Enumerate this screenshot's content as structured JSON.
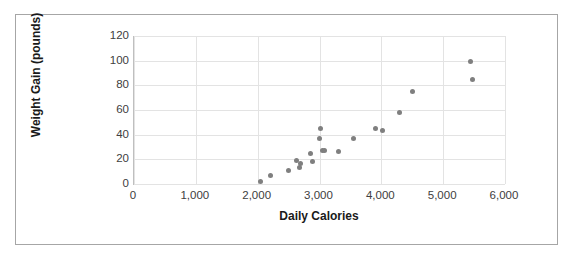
{
  "chart_data": {
    "type": "scatter",
    "title": "",
    "xlabel": "Daily Calories",
    "ylabel": "Weight Gain (pounds)",
    "xlim": [
      0,
      6000
    ],
    "ylim": [
      0,
      120
    ],
    "xticks": [
      "0",
      "1,000",
      "2,000",
      "3,000",
      "4,000",
      "5,000",
      "6,000"
    ],
    "xtick_values": [
      0,
      1000,
      2000,
      3000,
      4000,
      5000,
      6000
    ],
    "yticks": [
      "0",
      "20",
      "40",
      "60",
      "80",
      "100",
      "120"
    ],
    "ytick_values": [
      0,
      20,
      40,
      60,
      80,
      100,
      120
    ],
    "grid": true,
    "legend": false,
    "marker_color": "#7f7f7f",
    "points": [
      {
        "x": 2050,
        "y": 2
      },
      {
        "x": 2200,
        "y": 7
      },
      {
        "x": 2500,
        "y": 11
      },
      {
        "x": 2620,
        "y": 19
      },
      {
        "x": 2700,
        "y": 17
      },
      {
        "x": 2680,
        "y": 13
      },
      {
        "x": 2850,
        "y": 25
      },
      {
        "x": 2880,
        "y": 18
      },
      {
        "x": 3000,
        "y": 37
      },
      {
        "x": 3020,
        "y": 45
      },
      {
        "x": 3050,
        "y": 27
      },
      {
        "x": 3080,
        "y": 27
      },
      {
        "x": 3300,
        "y": 26
      },
      {
        "x": 3550,
        "y": 37
      },
      {
        "x": 3900,
        "y": 45
      },
      {
        "x": 4020,
        "y": 43
      },
      {
        "x": 4300,
        "y": 58
      },
      {
        "x": 4500,
        "y": 75
      },
      {
        "x": 5450,
        "y": 99
      },
      {
        "x": 5480,
        "y": 85
      }
    ]
  }
}
